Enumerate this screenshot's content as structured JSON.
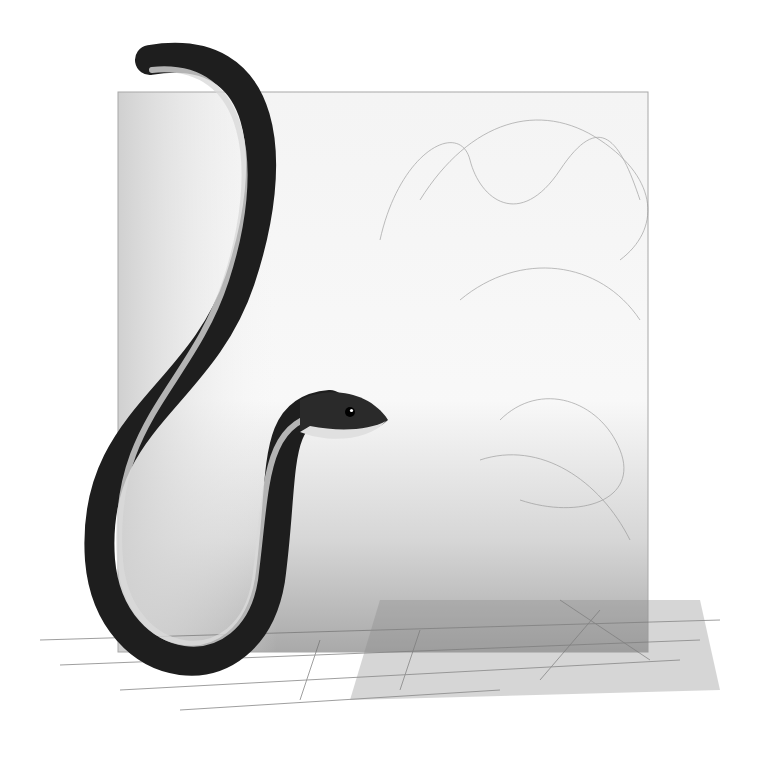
{
  "artwork": {
    "description": "Pencil/charcoal drawing of a dark snake rising in an S-curve in front of a sketched square background with grass at the base",
    "subject": "snake",
    "medium": "graphite/charcoal sketch",
    "colors": {
      "background": "#ffffff",
      "panel": "#e6e6e6",
      "panel_dark": "#bdbdbd",
      "snake_body": "#1e1e1e",
      "snake_belly": "#d9d9d9",
      "grass": "#7a7a7a"
    }
  }
}
